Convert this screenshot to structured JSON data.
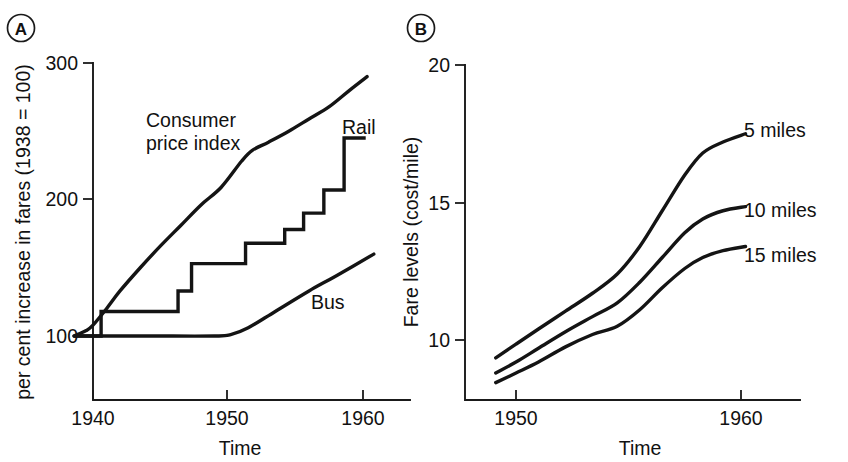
{
  "figure": {
    "title": "",
    "background": "#ffffff",
    "ink_color": "#141414",
    "panels": [
      {
        "letter": "A"
      },
      {
        "letter": "B"
      }
    ]
  },
  "panel_a": {
    "letter": "A",
    "ylabel": "per cent increase in fares (1938 = 100)",
    "xlabel": "Time",
    "ytick_labels": [
      "100",
      "200",
      "300"
    ],
    "xtick_labels": [
      "1940",
      "1950",
      "1960"
    ],
    "series_labels": {
      "cpi": "Consumer\nprice index",
      "cpi_line1": "Consumer",
      "cpi_line2": "price index",
      "rail": "Rail",
      "bus": "Bus"
    }
  },
  "panel_b": {
    "letter": "B",
    "ylabel": "Fare levels (cost/mile)",
    "xlabel": "Time",
    "ytick_labels": [
      "10",
      "15",
      "20"
    ],
    "xtick_labels": [
      "1950",
      "1960"
    ],
    "series_labels": {
      "m5": "5 miles",
      "m10": "10 miles",
      "m15": "15 miles"
    }
  },
  "chart_data": [
    {
      "id": "panel-a",
      "type": "line",
      "title": "A",
      "xlabel": "Time",
      "ylabel": "per cent increase in fares (1938 = 100)",
      "xlim": [
        1938.4,
        1961.2
      ],
      "ylim": [
        62,
        300
      ],
      "yticks": [
        100,
        200,
        300
      ],
      "xticks": [
        1940,
        1950,
        1960
      ],
      "grid": false,
      "legend": "inline-annotations",
      "series": [
        {
          "name": "Consumer price index",
          "style": "smooth",
          "x": [
            1938.6,
            1939.5,
            1940.0,
            1941.0,
            1942.0,
            1943.5,
            1945.0,
            1946.5,
            1948.0,
            1949.5,
            1951.0,
            1951.8,
            1953.0,
            1954.5,
            1956.0,
            1957.5,
            1959.0,
            1960.3
          ],
          "y": [
            100,
            104,
            108,
            120,
            133,
            150,
            166,
            181,
            196,
            209,
            228,
            236,
            242,
            250,
            259,
            268,
            280,
            290
          ]
        },
        {
          "name": "Rail",
          "style": "step",
          "x": [
            1938.6,
            1940.6,
            1940.6,
            1946.3,
            1946.3,
            1947.3,
            1947.3,
            1951.3,
            1951.3,
            1954.2,
            1954.2,
            1955.6,
            1955.6,
            1957.1,
            1957.1,
            1958.6,
            1958.6,
            1960.2
          ],
          "y": [
            100,
            100,
            118,
            118,
            133,
            133,
            153,
            153,
            168,
            168,
            178,
            178,
            190,
            190,
            207,
            207,
            245,
            245
          ]
        },
        {
          "name": "Bus",
          "style": "smooth",
          "x": [
            1938.6,
            1944.0,
            1949.0,
            1950.2,
            1951.5,
            1953.5,
            1956.0,
            1958.0,
            1960.8
          ],
          "y": [
            100,
            100,
            100,
            101,
            106,
            118,
            133,
            144,
            160
          ]
        }
      ]
    },
    {
      "id": "panel-b",
      "type": "line",
      "title": "B",
      "xlabel": "Time",
      "ylabel": "Fare levels (cost/mile)",
      "xlim": [
        1948.6,
        1961.8
      ],
      "ylim": [
        8.2,
        20
      ],
      "yticks": [
        10,
        15,
        20
      ],
      "xticks": [
        1950,
        1960
      ],
      "grid": false,
      "legend": "inline-annotations",
      "series": [
        {
          "name": "5 miles",
          "x": [
            1949.1,
            1950.0,
            1951.0,
            1952.2,
            1953.4,
            1954.5,
            1955.5,
            1956.5,
            1957.5,
            1958.3,
            1959.2,
            1960.2
          ],
          "y": [
            9.35,
            9.85,
            10.4,
            11.05,
            11.7,
            12.4,
            13.4,
            14.7,
            16.0,
            16.8,
            17.2,
            17.5
          ]
        },
        {
          "name": "10 miles",
          "x": [
            1949.1,
            1950.0,
            1951.0,
            1952.2,
            1953.4,
            1954.5,
            1955.5,
            1956.5,
            1957.5,
            1958.3,
            1959.2,
            1960.2
          ],
          "y": [
            8.8,
            9.2,
            9.7,
            10.3,
            10.85,
            11.35,
            12.1,
            13.0,
            13.9,
            14.4,
            14.7,
            14.85
          ]
        },
        {
          "name": "15 miles",
          "x": [
            1949.1,
            1950.0,
            1951.0,
            1952.2,
            1953.4,
            1954.5,
            1955.5,
            1956.5,
            1957.5,
            1958.3,
            1959.2,
            1960.2
          ],
          "y": [
            8.45,
            8.8,
            9.2,
            9.75,
            10.2,
            10.5,
            11.1,
            11.9,
            12.6,
            13.0,
            13.25,
            13.4
          ]
        }
      ]
    }
  ]
}
